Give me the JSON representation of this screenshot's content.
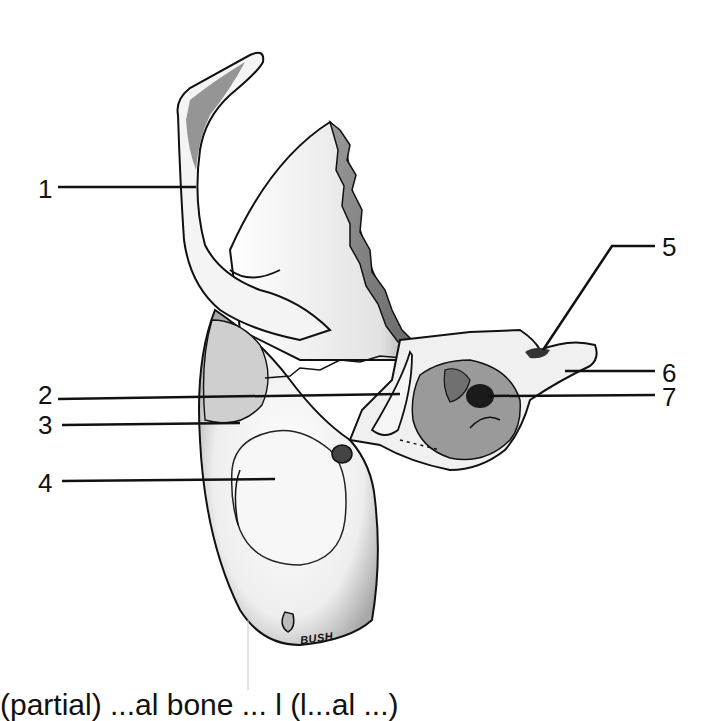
{
  "figure": {
    "labels": [
      {
        "number": "1",
        "x": 38,
        "y": 176
      },
      {
        "number": "2",
        "x": 38,
        "y": 382
      },
      {
        "number": "3",
        "x": 38,
        "y": 412
      },
      {
        "number": "4",
        "x": 38,
        "y": 470
      },
      {
        "number": "5",
        "x": 664,
        "y": 234
      },
      {
        "number": "6",
        "x": 664,
        "y": 360
      },
      {
        "number": "7",
        "x": 664,
        "y": 384
      }
    ],
    "signature": "BUSH",
    "caption": "(partial) ...al bone ... l (l...al ...)"
  },
  "colors": {
    "ink": "#111111",
    "shade": "#8a8a8a",
    "dark_shade": "#555555",
    "background": "#ffffff"
  }
}
